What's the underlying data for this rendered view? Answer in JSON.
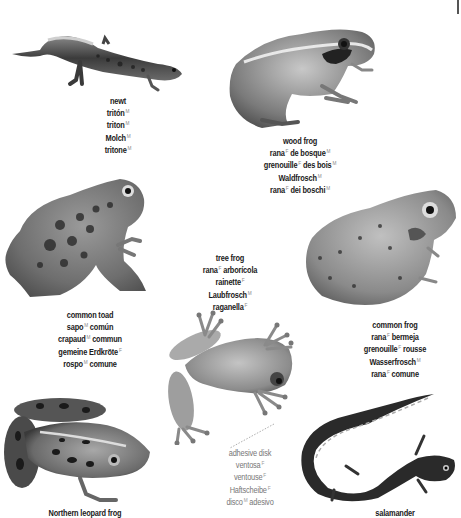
{
  "page": {
    "corner_mark": "|"
  },
  "animals": [
    {
      "id": "newt",
      "name": "newt",
      "translations": [
        {
          "word": "tritón",
          "gender": "M"
        },
        {
          "word": "triton",
          "gender": "M"
        },
        {
          "word": "Molch",
          "gender": "M"
        },
        {
          "word": "tritone",
          "gender": "M"
        }
      ]
    },
    {
      "id": "wood-frog",
      "name": "wood frog",
      "translations": [
        {
          "parts": [
            {
              "word": "rana",
              "gender": "F"
            },
            {
              "word": "de bosque",
              "gender": "M"
            }
          ]
        },
        {
          "parts": [
            {
              "word": "grenouille",
              "gender": "F"
            },
            {
              "word": "des bois",
              "gender": "M"
            }
          ]
        },
        {
          "parts": [
            {
              "word": "Waldfrosch",
              "gender": "M"
            }
          ]
        },
        {
          "parts": [
            {
              "word": "rana",
              "gender": "F"
            },
            {
              "word": "dei boschi",
              "gender": "M"
            }
          ]
        }
      ]
    },
    {
      "id": "tree-frog",
      "name": "tree frog",
      "translations": [
        {
          "parts": [
            {
              "word": "rana",
              "gender": "F"
            },
            {
              "word": "arborícola",
              "gender": ""
            }
          ]
        },
        {
          "parts": [
            {
              "word": "rainette",
              "gender": "F"
            }
          ]
        },
        {
          "parts": [
            {
              "word": "Laubfrosch",
              "gender": "M"
            }
          ]
        },
        {
          "parts": [
            {
              "word": "raganella",
              "gender": "F"
            }
          ]
        }
      ]
    },
    {
      "id": "common-toad",
      "name": "common toad",
      "translations": [
        {
          "parts": [
            {
              "word": "sapo",
              "gender": "M"
            },
            {
              "word": "común",
              "gender": ""
            }
          ]
        },
        {
          "parts": [
            {
              "word": "crapaud",
              "gender": "M"
            },
            {
              "word": "commun",
              "gender": ""
            }
          ]
        },
        {
          "parts": [
            {
              "word": "gemeine Erdkröte",
              "gender": "F"
            }
          ]
        },
        {
          "parts": [
            {
              "word": "rospo",
              "gender": "M"
            },
            {
              "word": "comune",
              "gender": ""
            }
          ]
        }
      ]
    },
    {
      "id": "common-frog",
      "name": "common frog",
      "translations": [
        {
          "parts": [
            {
              "word": "rana",
              "gender": "F"
            },
            {
              "word": "bermeja",
              "gender": ""
            }
          ]
        },
        {
          "parts": [
            {
              "word": "grenouille",
              "gender": "F"
            },
            {
              "word": "rousse",
              "gender": ""
            }
          ]
        },
        {
          "parts": [
            {
              "word": "Wasserfrosch",
              "gender": "M"
            }
          ]
        },
        {
          "parts": [
            {
              "word": "rana",
              "gender": "F"
            },
            {
              "word": "comune",
              "gender": ""
            }
          ]
        }
      ]
    },
    {
      "id": "northern-leopard-frog",
      "name": "Northern leopard frog",
      "translations": []
    },
    {
      "id": "salamander",
      "name": "salamander",
      "translations": []
    }
  ],
  "callout": {
    "name": "adhesive disk",
    "translations": [
      {
        "parts": [
          {
            "word": "ventosa",
            "gender": "F"
          }
        ]
      },
      {
        "parts": [
          {
            "word": "ventouse",
            "gender": "F"
          }
        ]
      },
      {
        "parts": [
          {
            "word": "Haftscheibe",
            "gender": "F"
          }
        ]
      },
      {
        "parts": [
          {
            "word": "disco",
            "gender": "M"
          },
          {
            "word": "adesivo",
            "gender": ""
          }
        ]
      }
    ]
  },
  "colors": {
    "text": "#1a1a1a",
    "callout_text": "#777777",
    "gender_marker": "#888888",
    "background": "#ffffff"
  }
}
